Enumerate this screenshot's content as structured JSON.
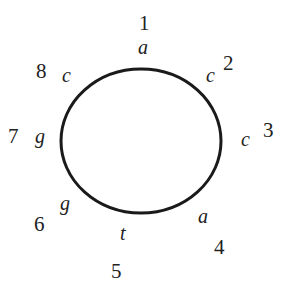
{
  "diagram": {
    "type": "circular-sequence",
    "positions": [
      {
        "index": "1",
        "base": "a"
      },
      {
        "index": "2",
        "base": "c"
      },
      {
        "index": "3",
        "base": "c"
      },
      {
        "index": "4",
        "base": "a"
      },
      {
        "index": "5",
        "base": "t"
      },
      {
        "index": "6",
        "base": "g"
      },
      {
        "index": "7",
        "base": "g"
      },
      {
        "index": "8",
        "base": "c"
      }
    ]
  }
}
